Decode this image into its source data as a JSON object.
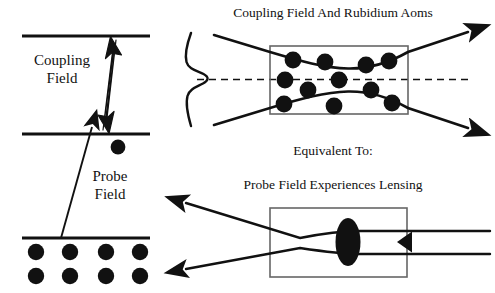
{
  "figure": {
    "width": 495,
    "height": 293,
    "background": "#ffffff",
    "ink_color": "#111111",
    "cell_outline_color": "#555555"
  },
  "left_panel": {
    "name": "three-level-energy-diagram",
    "labels": {
      "coupling_field_line1": "Coupling",
      "coupling_field_line2": "Field",
      "probe_field_line1": "Probe",
      "probe_field_line2": "Field"
    },
    "energy_levels": [
      {
        "id": "upper-level",
        "y": 36,
        "x1": 22,
        "x2": 150
      },
      {
        "id": "middle-level",
        "y": 134,
        "x1": 22,
        "x2": 150
      },
      {
        "id": "ground-level",
        "y": 238,
        "x1": 22,
        "x2": 150
      }
    ],
    "transitions": [
      {
        "id": "coupling-double-arrow",
        "label": "Coupling Field",
        "style": "thick-double-headed",
        "from_level": "middle-level",
        "to_level": "upper-level"
      },
      {
        "id": "probe-single-arrow",
        "label": "Probe Field",
        "style": "thin-single-headed",
        "from_level": "ground-level",
        "to_level": "middle-level"
      }
    ],
    "excited_population_dots": 1,
    "ground_population_dots": 8,
    "ground_population_rows": 2,
    "ground_population_cols": 4
  },
  "right_panel": {
    "top": {
      "name": "coupling-field-cell",
      "title": "Coupling Field And Rubidium Aoms",
      "atom_count": 12,
      "beam_shape": "hourglass-focused",
      "profile_curve": "gaussian-transverse-profile",
      "axis_style": "dashed",
      "beam_direction": "left-to-right",
      "arrowheads": 2
    },
    "middle": {
      "name": "equivalence-caption",
      "text": "Equivalent To:"
    },
    "bottom": {
      "name": "probe-lensing-cell",
      "title": "Probe Field Experiences Lensing",
      "lens_shape": "filled-ellipse",
      "beam_direction": "right-to-left",
      "arrowheads": 3,
      "diverging": true
    }
  }
}
